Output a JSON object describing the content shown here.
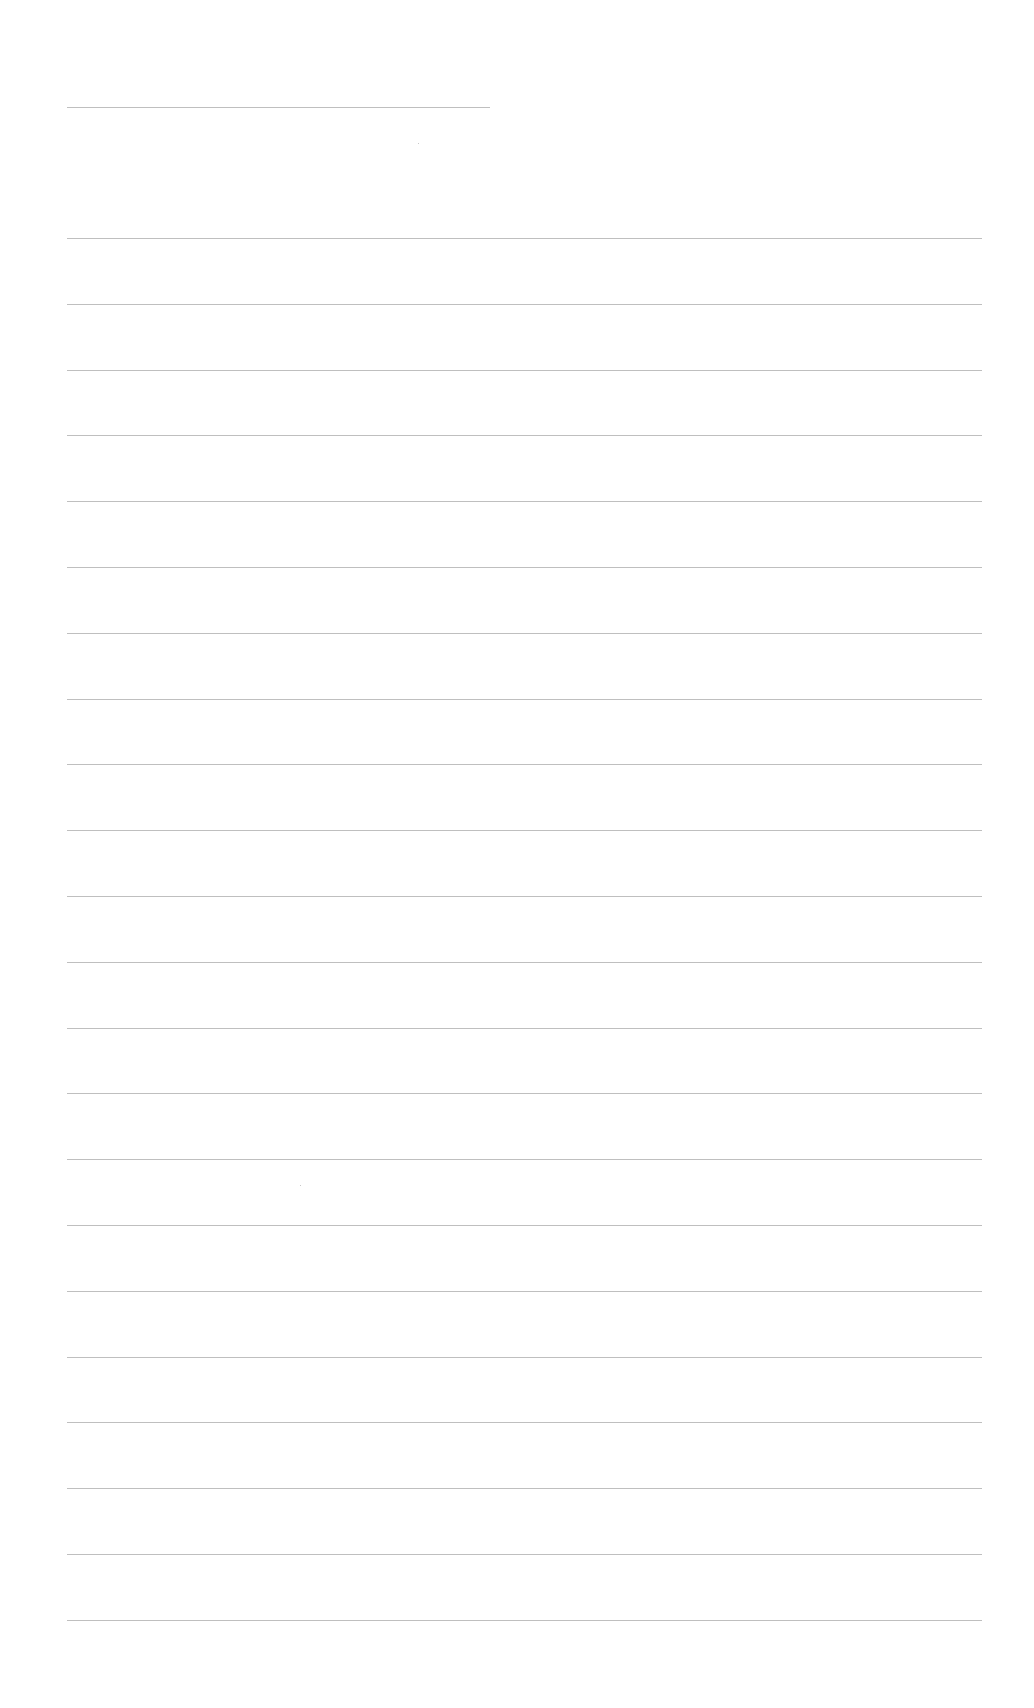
{
  "document": {
    "type": "blank-lined-page",
    "header_line": {
      "x": 67,
      "y": 107,
      "width": 423
    },
    "body_lines": {
      "count": 22,
      "x": 67,
      "first_y": 238,
      "spacing": 65.8,
      "width": 915
    },
    "rule_color": "#a9a9a9",
    "background_color": "#ffffff"
  }
}
